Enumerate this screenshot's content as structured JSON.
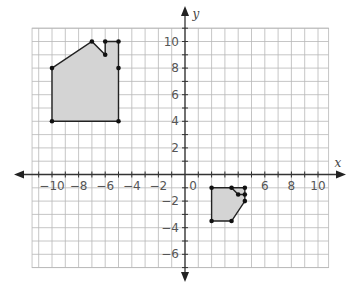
{
  "chart_data": {
    "type": "scatter",
    "title": "",
    "xlabel": "x",
    "ylabel": "y",
    "xlim": [
      -11.5,
      10.8
    ],
    "ylim": [
      -7,
      11
    ],
    "grid": true,
    "x_tick_labels": [
      "-10",
      "-8",
      "-6",
      "-4",
      "-2",
      "0",
      "6",
      "8",
      "10"
    ],
    "x_tick_values": [
      -10,
      -8,
      -6,
      -4,
      -2,
      0,
      6,
      8,
      10
    ],
    "y_tick_labels": [
      "10",
      "8",
      "6",
      "4",
      "2",
      "-2",
      "-4",
      "-6"
    ],
    "y_tick_values": [
      10,
      8,
      6,
      4,
      2,
      -2,
      -4,
      -6
    ],
    "series": [
      {
        "name": "Figure A (house)",
        "fill": "#d4d4d4",
        "polygon": [
          [
            -10,
            8
          ],
          [
            -7,
            10
          ],
          [
            -6,
            9
          ],
          [
            -6,
            10
          ],
          [
            -5,
            10
          ],
          [
            -5,
            8
          ],
          [
            -5,
            4
          ],
          [
            -10,
            4
          ]
        ],
        "vertices": [
          [
            -10,
            8
          ],
          [
            -7,
            10
          ],
          [
            -6,
            10
          ],
          [
            -5,
            10
          ],
          [
            -6,
            9
          ],
          [
            -5,
            8
          ],
          [
            -5,
            4
          ],
          [
            -10,
            4
          ]
        ]
      },
      {
        "name": "Figure B (image)",
        "fill": "#d4d4d4",
        "polygon": [
          [
            2,
            -1
          ],
          [
            3.5,
            -1
          ],
          [
            4.5,
            -1
          ],
          [
            4.5,
            -2
          ],
          [
            3.5,
            -3.5
          ],
          [
            2,
            -3.5
          ]
        ],
        "inner_lines": [
          [
            [
              3.5,
              -1
            ],
            [
              4,
              -1.5
            ],
            [
              4.5,
              -1.5
            ]
          ]
        ],
        "vertices": [
          [
            2,
            -1
          ],
          [
            3.5,
            -1
          ],
          [
            4.5,
            -1
          ],
          [
            4,
            -1.5
          ],
          [
            4.5,
            -1.5
          ],
          [
            4.5,
            -2
          ],
          [
            3.5,
            -3.5
          ],
          [
            2,
            -3.5
          ]
        ]
      }
    ]
  },
  "colors": {
    "grid": "#b8b8b8",
    "axis": "#333333",
    "shape_fill": "#d4d4d4",
    "shape_stroke": "#222222"
  }
}
